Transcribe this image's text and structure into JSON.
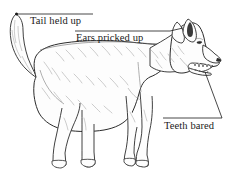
{
  "figure": {
    "view": "side profile facing right",
    "line_color": "#2b2b2b",
    "fill_color": "#fdfdfd",
    "shading_color": "#a8a8a8",
    "background_color": "#ffffff",
    "text_color": "#1a1a1a"
  },
  "labels": [
    {
      "id": "tail",
      "text": "Tail held up",
      "leader": "horizontal rule above text, extending left to tail tip"
    },
    {
      "id": "ears",
      "text": "Ears pricked up",
      "leader": "horizontal rule above text, extending right to ears"
    },
    {
      "id": "teeth",
      "text": "Teeth bared",
      "leader": "horizontal rule above text, with diagonal rising right to the muzzle"
    }
  ]
}
